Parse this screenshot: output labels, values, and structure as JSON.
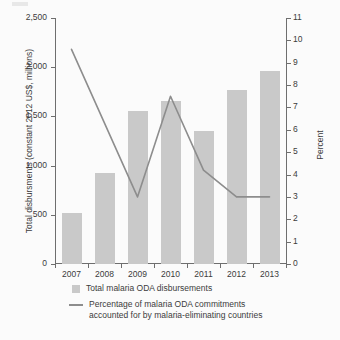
{
  "chart_data": {
    "type": "bar",
    "title": "",
    "subtitle": "",
    "xlabel": "",
    "ylabel": "Total disbursments (constant 2012 US$, millions)",
    "y2label": "Percent",
    "categories": [
      "2007",
      "2008",
      "2009",
      "2010",
      "2011",
      "2012",
      "2013"
    ],
    "ylim": [
      0,
      2500
    ],
    "y2lim": [
      0,
      11
    ],
    "yticks": [
      "0",
      "500",
      "1,000",
      "1,500",
      "2,000",
      "2,500"
    ],
    "ytick_values": [
      0,
      500,
      1000,
      1500,
      2000,
      2500
    ],
    "y2ticks": [
      "0",
      "1",
      "2",
      "3",
      "4",
      "5",
      "6",
      "7",
      "8",
      "9",
      "10",
      "11"
    ],
    "y2tick_values": [
      0,
      1,
      2,
      3,
      4,
      5,
      6,
      7,
      8,
      9,
      10,
      11
    ],
    "grid": false,
    "legend_position": "bottom",
    "series": [
      {
        "name": "Total malaria ODA disbursements",
        "type": "bar",
        "axis": "left",
        "color": "#c9c9c9",
        "values": [
          520,
          920,
          1550,
          1660,
          1350,
          1770,
          1960
        ]
      },
      {
        "name": "Percentage of malaria ODA commitments accounted for by malaria-eliminating countries",
        "type": "line",
        "axis": "right",
        "color": "#8d8d8d",
        "values": [
          9.6,
          6.3,
          3.0,
          7.5,
          4.2,
          3.0,
          3.0
        ]
      }
    ]
  },
  "legend": {
    "bar_label": "Total malaria ODA disbursements",
    "line_label_line1": "Percentage of malaria ODA commitments",
    "line_label_line2": "accounted for by malaria-eliminating countries"
  },
  "colors": {
    "bar": "#c9c9c9",
    "line": "#8d8d8d",
    "axis": "#6e6e6e",
    "background": "#fbfbfb",
    "text": "#3b3b3b"
  }
}
